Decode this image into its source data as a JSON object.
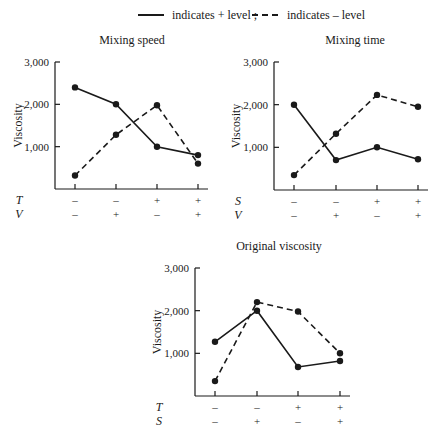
{
  "legend": {
    "solid_label": "indicates + level ;",
    "dashed_label": "indicates – level"
  },
  "colors": {
    "ink": "#1a1a1a",
    "background": "#ffffff"
  },
  "chart_data": [
    {
      "type": "line",
      "title": "Mixing speed",
      "ylabel": "Viscosity",
      "xlabel": "",
      "ylim": [
        0,
        3000
      ],
      "yticks": [
        1000,
        2000,
        3000
      ],
      "ytick_labels": [
        "1,000",
        "2,000",
        "3,000"
      ],
      "factor_rows": [
        {
          "name": "T",
          "levels": [
            "–",
            "–",
            "+",
            "+"
          ]
        },
        {
          "name": "V",
          "levels": [
            "–",
            "+",
            "–",
            "+"
          ]
        }
      ],
      "series": [
        {
          "name": "indicates + level",
          "style": "solid",
          "values": [
            2400,
            2000,
            1000,
            800
          ]
        },
        {
          "name": "indicates – level",
          "style": "dashed",
          "values": [
            320,
            1280,
            1980,
            600
          ]
        }
      ],
      "grid": false
    },
    {
      "type": "line",
      "title": "Mixing time",
      "ylabel": "Viscosity",
      "xlabel": "",
      "ylim": [
        0,
        3000
      ],
      "yticks": [
        1000,
        2000,
        3000
      ],
      "ytick_labels": [
        "1,000",
        "2,000",
        "3,000"
      ],
      "factor_rows": [
        {
          "name": "S",
          "levels": [
            "–",
            "–",
            "+",
            "+"
          ]
        },
        {
          "name": "V",
          "levels": [
            "–",
            "+",
            "–",
            "+"
          ]
        }
      ],
      "series": [
        {
          "name": "indicates + level",
          "style": "solid",
          "values": [
            2000,
            700,
            1000,
            720
          ]
        },
        {
          "name": "indicates – level",
          "style": "dashed",
          "values": [
            350,
            1320,
            2230,
            1950
          ]
        }
      ],
      "grid": false
    },
    {
      "type": "line",
      "title": "Original viscosity",
      "ylabel": "Viscosity",
      "xlabel": "",
      "ylim": [
        0,
        3000
      ],
      "yticks": [
        1000,
        2000,
        3000
      ],
      "ytick_labels": [
        "1,000",
        "2,000",
        "3,000"
      ],
      "factor_rows": [
        {
          "name": "T",
          "levels": [
            "–",
            "–",
            "+",
            "+"
          ]
        },
        {
          "name": "S",
          "levels": [
            "–",
            "+",
            "–",
            "+"
          ]
        }
      ],
      "series": [
        {
          "name": "indicates + level",
          "style": "solid",
          "values": [
            1270,
            2000,
            680,
            820
          ]
        },
        {
          "name": "indicates – level",
          "style": "dashed",
          "values": [
            350,
            2200,
            1980,
            1000
          ]
        }
      ],
      "grid": false
    }
  ]
}
